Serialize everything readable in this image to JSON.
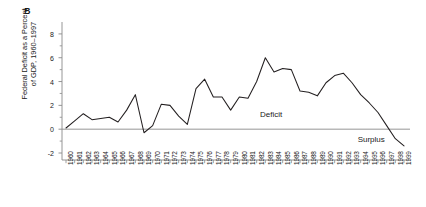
{
  "figure": {
    "panel_label": "B",
    "y_axis_title_line1": "Federal Deficit as a Percent",
    "y_axis_title_line2": "of GDP, 1960–1997",
    "line_color": "#231f20",
    "axis_color": "#8a8a8a",
    "text_color": "#1a1a1a"
  },
  "annotations": {
    "deficit": "Deficit",
    "surplus": "Surplus"
  },
  "chart_data": {
    "type": "line",
    "title": "",
    "subtitle": "",
    "xlabel": "",
    "ylabel": "Federal Deficit as a Percent of GDP, 1960–1997",
    "ylim": [
      -2,
      9
    ],
    "xlim": [
      1960,
      1999
    ],
    "grid": false,
    "legend": "none",
    "y_ticks": [
      -2,
      0,
      2,
      4,
      6,
      8
    ],
    "y_tick_labels": [
      "-2",
      "0",
      "2",
      "4",
      "6",
      "8"
    ],
    "y_minor_ticks": [
      -1,
      1,
      3,
      5,
      7
    ],
    "zero_line": 0,
    "categories": [
      "1960",
      "1961",
      "1962",
      "1963",
      "1964",
      "1965",
      "1966",
      "1967",
      "1968",
      "1969",
      "1970",
      "1971",
      "1972",
      "1973",
      "1974",
      "1975",
      "1976",
      "1977",
      "1978",
      "1979",
      "1980",
      "1981",
      "1982",
      "1983",
      "1984",
      "1985",
      "1986",
      "1987",
      "1988",
      "1989",
      "1990",
      "1991",
      "1992",
      "1993",
      "1994",
      "1995",
      "1996",
      "1997",
      "1998",
      "1999"
    ],
    "values": [
      0.1,
      0.7,
      1.3,
      0.8,
      0.9,
      1.0,
      0.6,
      1.6,
      2.9,
      -0.3,
      0.3,
      2.1,
      2.0,
      1.1,
      0.4,
      3.4,
      4.2,
      2.7,
      2.7,
      1.6,
      2.7,
      2.6,
      4.0,
      6.0,
      4.8,
      5.1,
      5.0,
      3.2,
      3.1,
      2.8,
      3.9,
      4.5,
      4.7,
      3.9,
      2.9,
      2.2,
      1.4,
      0.3,
      -0.8,
      -1.4
    ],
    "series": [
      {
        "name": "Federal deficit as percent of GDP",
        "values": [
          0.1,
          0.7,
          1.3,
          0.8,
          0.9,
          1.0,
          0.6,
          1.6,
          2.9,
          -0.3,
          0.3,
          2.1,
          2.0,
          1.1,
          0.4,
          3.4,
          4.2,
          2.7,
          2.7,
          1.6,
          2.7,
          2.6,
          4.0,
          6.0,
          4.8,
          5.1,
          5.0,
          3.2,
          3.1,
          2.8,
          3.9,
          4.5,
          4.7,
          3.9,
          2.9,
          2.2,
          1.4,
          0.3,
          -0.8,
          -1.4
        ]
      }
    ],
    "annotations": [
      {
        "text": "Deficit",
        "x": 1984,
        "y": 1.2
      },
      {
        "text": "Surplus",
        "x": 1995.5,
        "y": -0.9
      }
    ]
  }
}
